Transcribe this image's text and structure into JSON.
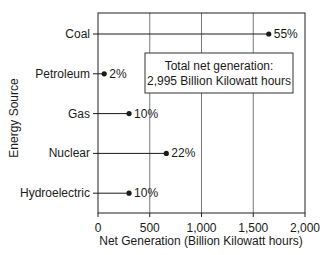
{
  "chart_data": {
    "type": "dot",
    "orientation": "horizontal",
    "title": "",
    "xlabel": "Net Generation (Billion Kilowatt hours)",
    "ylabel": "Energy Source",
    "xlim": [
      0,
      2000
    ],
    "xticks": [
      0,
      500,
      1000,
      1500,
      2000
    ],
    "xtick_labels": [
      "0",
      "500",
      "1,000",
      "1,500",
      "2,000"
    ],
    "grid": {
      "x": true,
      "y": false
    },
    "categories": [
      "Coal",
      "Petroleum",
      "Gas",
      "Nuclear",
      "Hydroelectric"
    ],
    "values": [
      1650,
      60,
      300,
      660,
      300
    ],
    "percent_labels": [
      "55%",
      "2%",
      "10%",
      "22%",
      "10%"
    ],
    "annotation": {
      "line1": "Total net generation:",
      "line2": "2,995 Billion Kilowatt hours"
    },
    "colors": {
      "line": "#1a1a1a",
      "grid": "#555555",
      "background": "#ffffff"
    }
  }
}
